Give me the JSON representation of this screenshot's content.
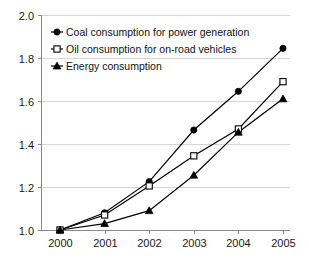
{
  "chart_data": {
    "type": "line",
    "title": "",
    "subtitle": "",
    "xlabel": "",
    "ylabel": "",
    "categories": [
      "2000",
      "2001",
      "2002",
      "2003",
      "2004",
      "2005"
    ],
    "x": [
      2000,
      2001,
      2002,
      2003,
      2004,
      2005
    ],
    "ylim": [
      1.0,
      2.0
    ],
    "ytick_labels": [
      "1.0",
      "1.2",
      "1.4",
      "1.6",
      "1.8",
      "2.0"
    ],
    "ytick_values": [
      1.0,
      1.2,
      1.4,
      1.6,
      1.8,
      2.0
    ],
    "grid": true,
    "grid_axis": "y",
    "legend_position": "top-left",
    "series": [
      {
        "name": "Coal consumption for power generation",
        "marker": "filled-circle",
        "color": "#000000",
        "values": [
          1.0,
          1.08,
          1.225,
          1.465,
          1.645,
          1.845
        ]
      },
      {
        "name": "Oil consumption for on-road vehicles",
        "marker": "open-square",
        "color": "#000000",
        "values": [
          1.0,
          1.07,
          1.205,
          1.345,
          1.47,
          1.69
        ]
      },
      {
        "name": "Energy consumption",
        "marker": "filled-triangle",
        "color": "#000000",
        "values": [
          1.0,
          1.03,
          1.09,
          1.255,
          1.455,
          1.61
        ]
      }
    ]
  },
  "axes": {
    "y_axis_name": "y-axis",
    "x_axis_name": "x-axis"
  }
}
